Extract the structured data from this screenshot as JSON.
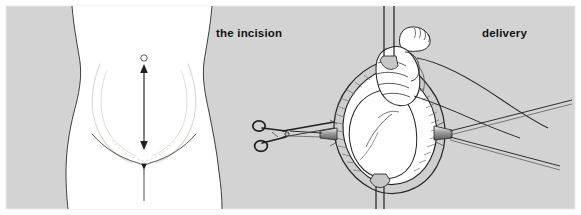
{
  "figure": {
    "width": 581,
    "height": 215,
    "background_color": "#ffffff",
    "plate_color": "#d3d3d3",
    "skin_color": "#ffffff",
    "ink_color": "#1a1a1a",
    "guide_color": "#d8d2cc",
    "shade_color": "#9a9a9a",
    "border_color": "#e8e8e8"
  },
  "panels": [
    {
      "id": "incision",
      "label": "the incision",
      "label_x": 216,
      "label_y": 37,
      "description": "anterior view of lower abdomen with umbilicus, dashed uterine outline and a vertical double-headed arrow marking the midline incision from umbilicus to pubis"
    },
    {
      "id": "delivery",
      "label": "delivery",
      "label_x": 482,
      "label_y": 37,
      "description": "retracted diamond-shaped abdominal incision with retractor blades; surgeon's hand grasps the fetal foot to deliver the infant; artery forceps clipped at the left incision margin"
    }
  ],
  "annotations": {
    "umbilicus": {
      "name": "umbilicus",
      "cx": 144,
      "cy": 58,
      "r": 3.2
    },
    "incision_arrow": {
      "name": "midline incision arrow",
      "x": 144,
      "y_top": 66,
      "y_bottom": 148,
      "double_headed": true
    },
    "midline_below": {
      "name": "pubic midline",
      "x": 144,
      "y_top": 163,
      "y_bottom": 200
    }
  },
  "instruments": [
    {
      "name": "artery-forceps",
      "position": "left margin of incision",
      "x": 258,
      "y": 122
    },
    {
      "name": "retractor-blade-upper-left",
      "position": "superior wound edge",
      "x": 386,
      "y": 0
    },
    {
      "name": "retractor-blade-upper-right",
      "position": "superior wound edge",
      "x": 396,
      "y": 0
    },
    {
      "name": "retractor-handle-right-upper",
      "position": "right wound edge",
      "x": 448,
      "y": 132
    },
    {
      "name": "retractor-handle-right-lower",
      "position": "right wound edge",
      "x": 448,
      "y": 140
    },
    {
      "name": "retractor-handle-left",
      "position": "left wound edge",
      "x": 292,
      "y": 134
    }
  ],
  "anatomy": [
    {
      "name": "fetus",
      "detail": "infant body within the uterine opening, breech/foot-first presentation"
    },
    {
      "name": "fetal-foot",
      "detail": "foot with toes grasped by the surgeon's hand"
    },
    {
      "name": "surgeons-hand",
      "detail": "gloved hand gripping the fetal ankle"
    },
    {
      "name": "surgeons-forearm",
      "detail": "forearm extending to the upper right"
    },
    {
      "name": "abdominal-wall",
      "detail": "cut layers of the abdominal wall forming the diamond wound"
    }
  ]
}
